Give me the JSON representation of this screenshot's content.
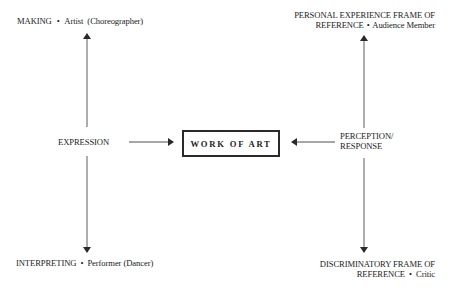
{
  "diagram": {
    "center": {
      "label": "WORK OF ART"
    },
    "top_left": {
      "role": "MAKING",
      "separator": "•",
      "actor": "Artist  (Choreographer)"
    },
    "bottom_left": {
      "role": "INTERPRETING",
      "separator": "•",
      "actor": "Performer (Dancer)"
    },
    "left_middle": {
      "label": "EXPRESSION"
    },
    "top_right": {
      "line1": "PERSONAL EXPERIENCE FRAME OF",
      "line2_role": "REFERENCE",
      "separator": "•",
      "actor": "Audience Member"
    },
    "bottom_right": {
      "line1": "DISCRIMINATORY FRAME OF",
      "line2_role": "REFERENCE",
      "separator": "•",
      "actor": "Critic"
    },
    "right_middle": {
      "line1": "PERCEPTION/",
      "line2": "RESPONSE"
    },
    "colors": {
      "line": "#3a3a3a",
      "text": "#222222",
      "background": "#ffffff"
    }
  }
}
